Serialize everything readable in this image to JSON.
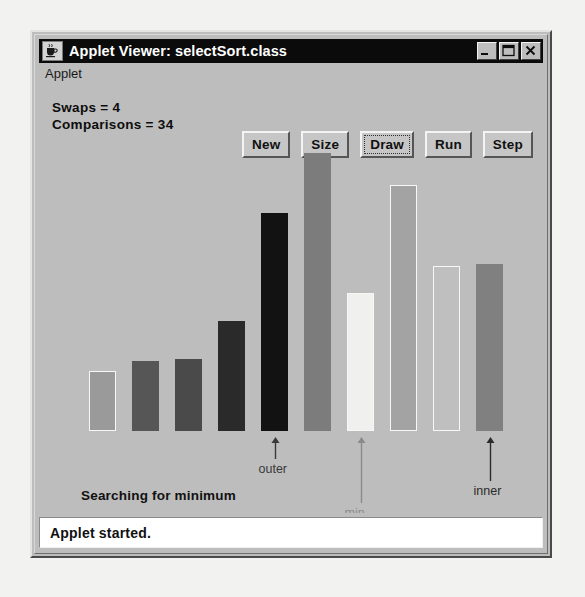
{
  "window": {
    "title": "Applet Viewer: selectSort.class",
    "icon": "java-coffee-cup-icon",
    "controls": [
      {
        "name": "minimize",
        "glyph": "minimize-icon"
      },
      {
        "name": "maximize",
        "glyph": "maximize-icon"
      },
      {
        "name": "close",
        "glyph": "close-icon"
      }
    ]
  },
  "menubar": {
    "items": [
      {
        "label": "Applet"
      }
    ]
  },
  "applet": {
    "counters": {
      "swaps": "Swaps = 4",
      "comparisons": "Comparisons = 34"
    },
    "status_message": "Searching for minimum"
  },
  "toolbar": {
    "buttons": [
      {
        "label": "New",
        "focused": false
      },
      {
        "label": "Size",
        "focused": false
      },
      {
        "label": "Draw",
        "focused": true
      },
      {
        "label": "Run",
        "focused": false
      },
      {
        "label": "Step",
        "focused": false
      }
    ]
  },
  "statusbar": {
    "text": "Applet started."
  },
  "chart_data": {
    "type": "bar",
    "xlabel": "",
    "ylabel": "",
    "grid": false,
    "legend": "none",
    "baseline_y": 430,
    "bar_width": 27,
    "categories": [
      "1",
      "2",
      "3",
      "4",
      "5",
      "6",
      "7",
      "8",
      "9",
      "10"
    ],
    "values": [
      60,
      70,
      72,
      110,
      218,
      278,
      138,
      246,
      165,
      167
    ],
    "colors": [
      "#9a9a9a",
      "#565656",
      "#4a4a4a",
      "#2a2a2a",
      "#121212",
      "#7c7c7c",
      "#f0f0ee",
      "#a3a3a3",
      "#bfbfbf",
      "#808080"
    ],
    "bars": [
      {
        "index": 1,
        "value": 60,
        "color": "#9a9a9a",
        "x": 88,
        "top": 370
      },
      {
        "index": 2,
        "value": 70,
        "color": "#565656",
        "x": 131,
        "top": 360
      },
      {
        "index": 3,
        "value": 72,
        "color": "#4a4a4a",
        "x": 174,
        "top": 358
      },
      {
        "index": 4,
        "value": 110,
        "color": "#2a2a2a",
        "x": 217,
        "top": 320
      },
      {
        "index": 5,
        "value": 218,
        "color": "#121212",
        "x": 260,
        "top": 212
      },
      {
        "index": 6,
        "value": 278,
        "color": "#7c7c7c",
        "x": 303,
        "top": 152
      },
      {
        "index": 7,
        "value": 138,
        "color": "#f0f0ee",
        "x": 346,
        "top": 292
      },
      {
        "index": 8,
        "value": 246,
        "color": "#a3a3a3",
        "x": 389,
        "top": 184
      },
      {
        "index": 9,
        "value": 165,
        "color": "#bfbfbf",
        "x": 432,
        "top": 265
      },
      {
        "index": 10,
        "value": 167,
        "color": "#808080",
        "x": 475,
        "top": 263
      }
    ],
    "annotations": [
      {
        "label": "outer",
        "bar_index": 5,
        "arrow_length": 22,
        "label_color": "#3a3a3a"
      },
      {
        "label": "min",
        "bar_index": 7,
        "arrow_length": 66,
        "label_color": "#8a8a8a"
      },
      {
        "label": "inner",
        "bar_index": 10,
        "arrow_length": 44,
        "label_color": "#2a2a2a"
      }
    ]
  }
}
